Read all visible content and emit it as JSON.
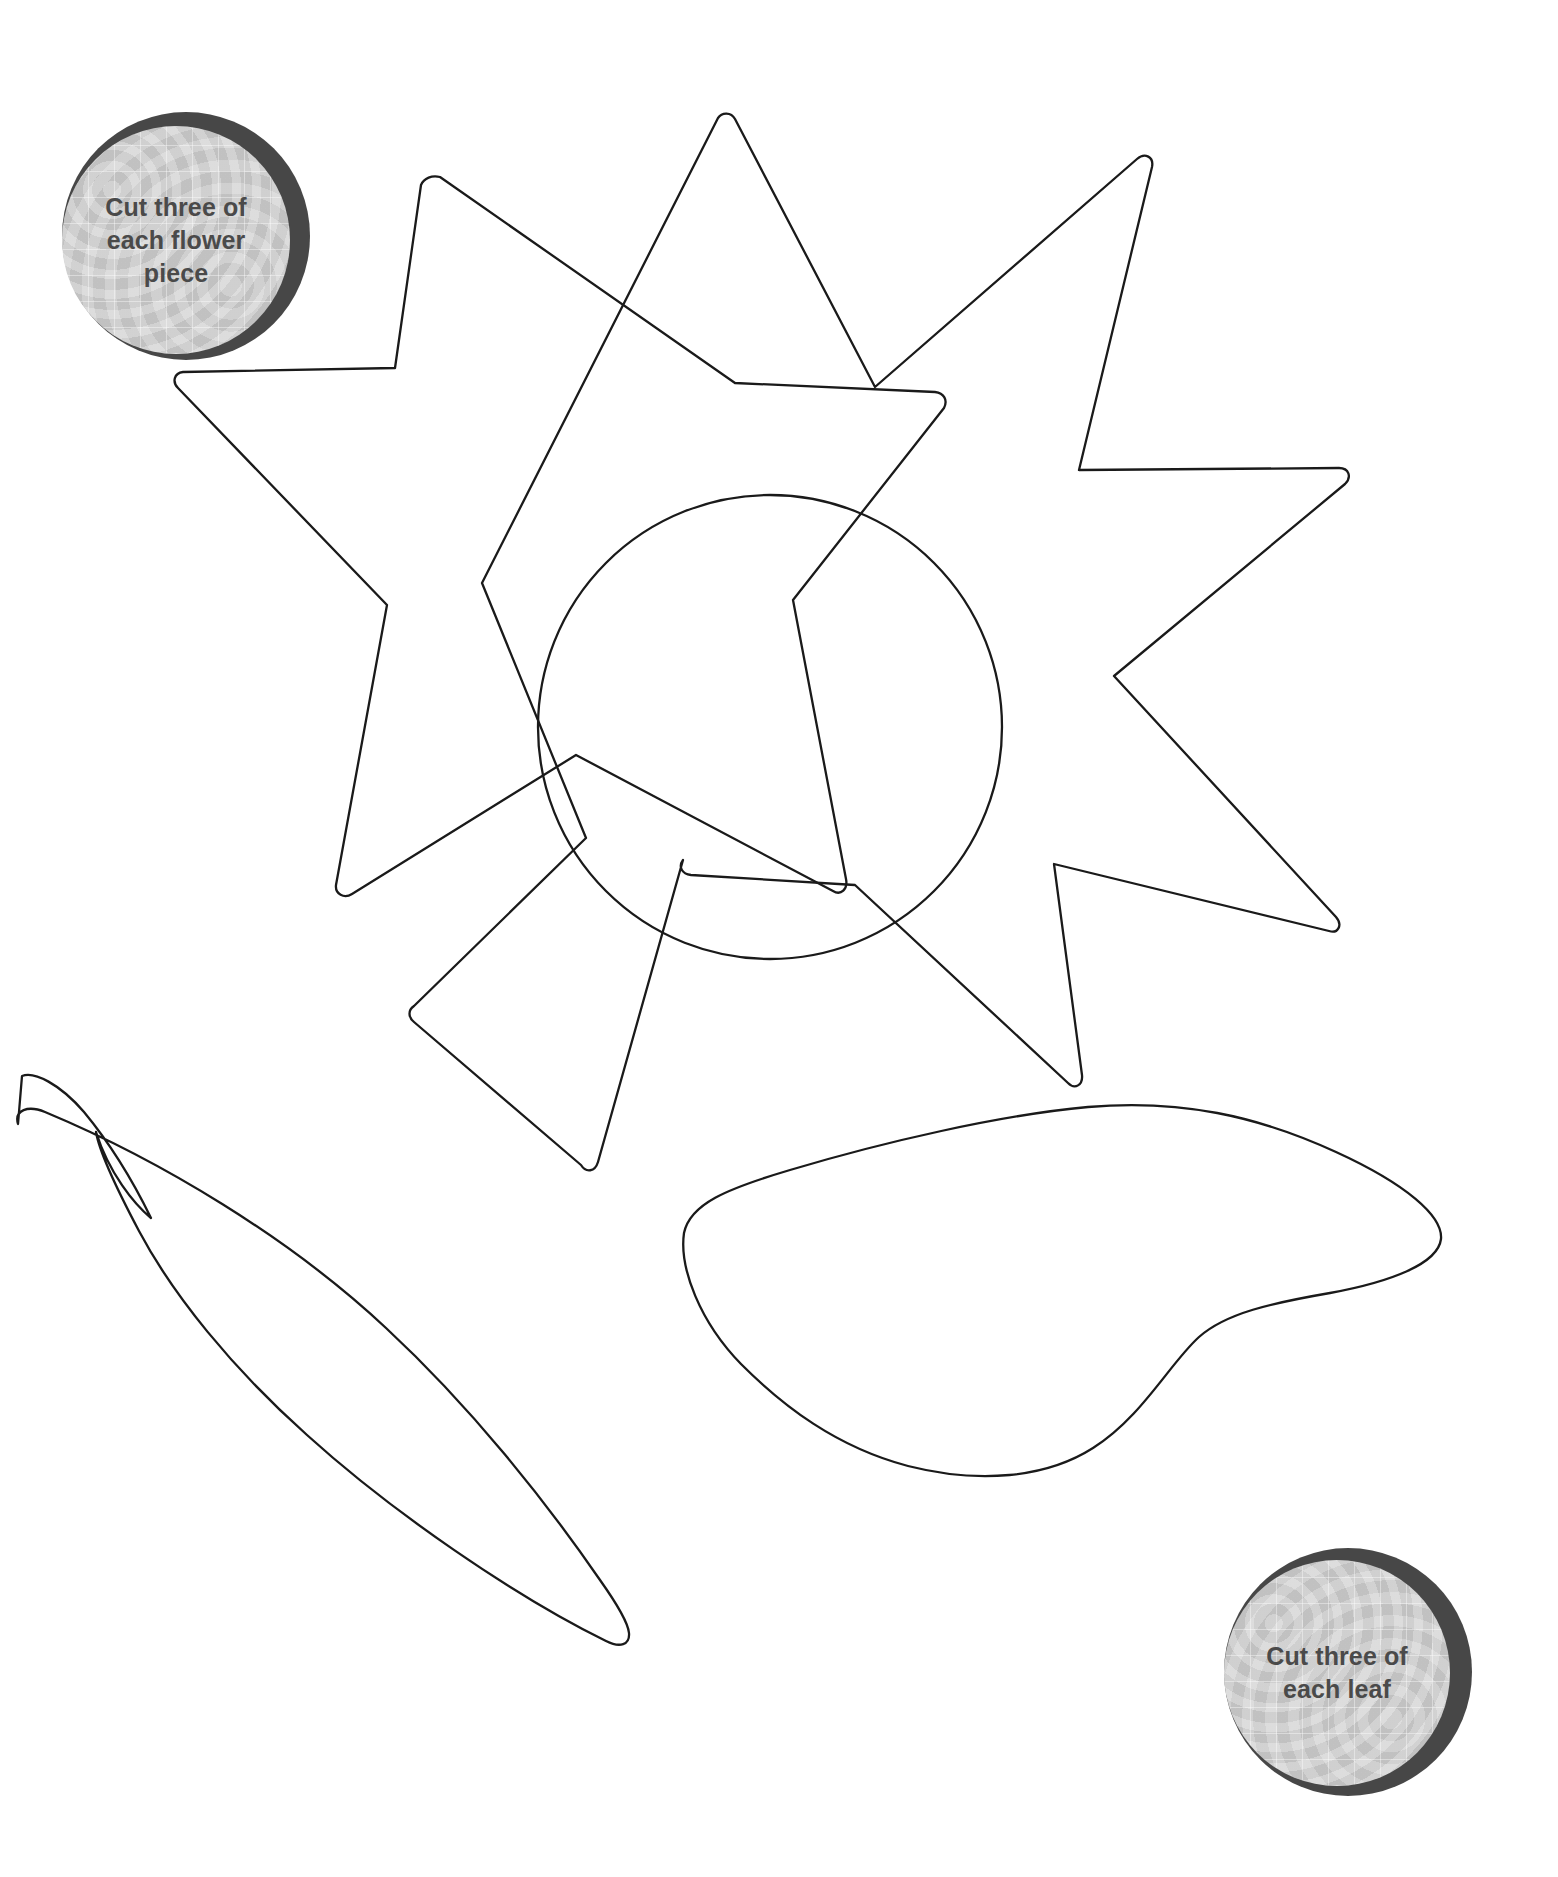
{
  "sheet": {
    "title": "Flower and Leaf Applique Template",
    "background_color": "#ffffff",
    "outline_color": "#1a1a1a",
    "outline_width": 2.2,
    "width": 1558,
    "height": 1877
  },
  "badges": [
    {
      "id": "flower-badge",
      "text": "Cut three of\neach flower\npiece",
      "lines": [
        "Cut three of",
        "each flower",
        "piece"
      ],
      "ring_color": "#474747",
      "face_color": "#c9c9c9",
      "text_color": "#4a4a4a",
      "position": "top-left"
    },
    {
      "id": "leaf-badge",
      "text": "Cut three of\neach leaf",
      "lines": [
        "Cut three of",
        "each leaf"
      ],
      "ring_color": "#474747",
      "face_color": "#c9c9c9",
      "text_color": "#4a4a4a",
      "position": "bottom-right"
    }
  ],
  "pieces": [
    {
      "id": "flower-star-a",
      "name": "Flower petal layer A",
      "type": "five-point-star",
      "points": 5,
      "quantity": 3
    },
    {
      "id": "flower-star-b",
      "name": "Flower petal layer B",
      "type": "five-point-star",
      "points": 5,
      "quantity": 3
    },
    {
      "id": "flower-center",
      "name": "Flower centre circle",
      "type": "circle",
      "center_x": 770,
      "center_y": 725,
      "radius": 232,
      "quantity": 3
    },
    {
      "id": "leaf-left",
      "name": "Pointed leaf",
      "type": "leaf",
      "quantity": 3
    },
    {
      "id": "leaf-right",
      "name": "Rounded leaf",
      "type": "leaf",
      "quantity": 3
    }
  ]
}
